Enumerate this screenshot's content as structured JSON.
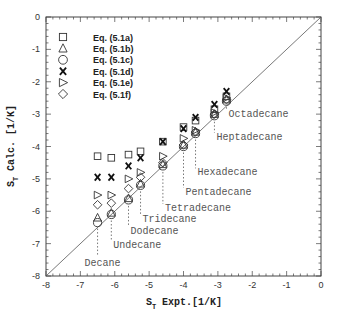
{
  "chart_data": {
    "type": "scatter",
    "title": "",
    "xlabel": "S_T Expt. [1/K]",
    "ylabel": "S_T Calc. [1/K]",
    "xlim": [
      -8,
      0
    ],
    "ylim": [
      -8,
      0
    ],
    "x_ticks": [
      "-8",
      "-7",
      "-6",
      "-5",
      "-4",
      "-3",
      "-2",
      "-1",
      "0"
    ],
    "y_ticks": [
      "0",
      "-1",
      "-2",
      "-3",
      "-4",
      "-5",
      "-6",
      "-7",
      "-8"
    ],
    "grid": false,
    "legend_position": "upper-left",
    "reference_line": "y = x",
    "categories": [
      "Decane",
      "Undecane",
      "Dodecane",
      "Tridecane",
      "Tetradecane",
      "Pentadecane",
      "Hexadecane",
      "Heptadecane",
      "Octadecane"
    ],
    "x": [
      -6.5,
      -6.1,
      -5.6,
      -5.25,
      -4.6,
      -4.0,
      -3.65,
      -3.1,
      -2.75
    ],
    "series": [
      {
        "name": "Eq. (5.1a)",
        "marker": "square",
        "values": [
          -4.3,
          -4.35,
          -4.25,
          -4.15,
          -3.85,
          -3.4,
          -3.2,
          -2.85,
          -2.45
        ]
      },
      {
        "name": "Eq. (5.1b)",
        "marker": "triangle-up",
        "values": [
          -6.2,
          -6.05,
          -5.6,
          -5.15,
          -4.55,
          -3.95,
          -3.55,
          -3.0,
          -2.55
        ]
      },
      {
        "name": "Eq. (5.1c)",
        "marker": "circle",
        "values": [
          -6.35,
          -6.1,
          -5.65,
          -5.2,
          -4.6,
          -4.0,
          -3.6,
          -3.05,
          -2.6
        ]
      },
      {
        "name": "Eq. (5.1d)",
        "marker": "x",
        "values": [
          -4.95,
          -4.95,
          -4.6,
          -4.35,
          -3.85,
          -3.45,
          -3.1,
          -2.7,
          -2.3
        ]
      },
      {
        "name": "Eq. (5.1e)",
        "marker": "triangle-right",
        "values": [
          -5.5,
          -5.5,
          -5.0,
          -4.8,
          -4.3,
          -3.75,
          -3.5,
          -2.95,
          -2.5
        ]
      },
      {
        "name": "Eq. (5.1f)",
        "marker": "diamond",
        "values": [
          -5.8,
          -5.75,
          -5.3,
          -4.95,
          -4.5,
          -3.95,
          -3.55,
          -3.0,
          -2.55
        ]
      }
    ],
    "annotations": [
      {
        "text": "Decane",
        "x": -6.5,
        "label_y": -7.5
      },
      {
        "text": "Undecane",
        "x": -6.1,
        "label_y": -7.05
      },
      {
        "text": "Dodecane",
        "x": -5.6,
        "label_y": -6.6
      },
      {
        "text": "Tridecane",
        "x": -5.25,
        "label_y": -6.25
      },
      {
        "text": "Tetradecane",
        "x": -4.6,
        "label_y": -5.9
      },
      {
        "text": "Pentadecane",
        "x": -4.0,
        "label_y": -5.4
      },
      {
        "text": "Hexadecane",
        "x": -3.65,
        "label_y": -4.8
      },
      {
        "text": "Heptadecane",
        "x": -3.1,
        "label_y": -3.7
      },
      {
        "text": "Octadecane",
        "x": -2.75,
        "label_y": -3.0
      }
    ]
  },
  "colors": {
    "axis": "#444444",
    "marker": "#333333",
    "annotation": "#555555",
    "line": "#555555"
  }
}
